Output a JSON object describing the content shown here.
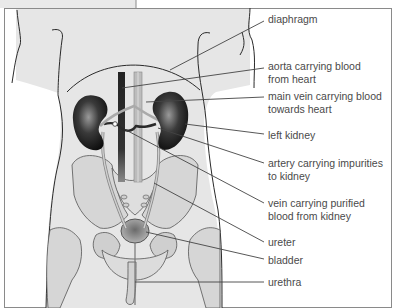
{
  "figure": {
    "colors": {
      "frame": "#8a8a8a",
      "body_fill": "#e6e6e6",
      "outline": "#2a2a2a",
      "leader": "#444444",
      "kidney": "#1a1a1a",
      "vessel_dark": "#333333",
      "vessel_light": "#bdbdbd",
      "bone": "#d4d4d4",
      "label_text": "#4a4a4a"
    }
  },
  "labels": [
    {
      "id": "diaphragm",
      "lines": [
        "diaphragm"
      ],
      "x": 268,
      "y": 13
    },
    {
      "id": "aorta",
      "lines": [
        "aorta carrying blood",
        "from heart"
      ],
      "x": 268,
      "y": 60
    },
    {
      "id": "main-vein",
      "lines": [
        "main vein carrying blood",
        "towards heart"
      ],
      "x": 268,
      "y": 90
    },
    {
      "id": "left-kidney",
      "lines": [
        "left kidney"
      ],
      "x": 268,
      "y": 129
    },
    {
      "id": "artery-impurities",
      "lines": [
        "artery carrying impurities",
        "to kidney"
      ],
      "x": 268,
      "y": 157
    },
    {
      "id": "vein-purified",
      "lines": [
        "vein carrying purified",
        "blood from kidney"
      ],
      "x": 268,
      "y": 197
    },
    {
      "id": "ureter",
      "lines": [
        "ureter"
      ],
      "x": 268,
      "y": 236
    },
    {
      "id": "bladder",
      "lines": [
        "bladder"
      ],
      "x": 268,
      "y": 254
    },
    {
      "id": "urethra",
      "lines": [
        "urethra"
      ],
      "x": 268,
      "y": 276
    }
  ]
}
